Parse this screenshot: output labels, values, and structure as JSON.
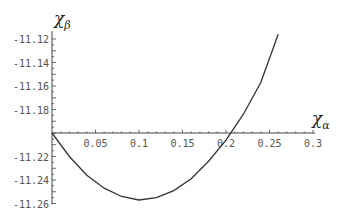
{
  "chart_data": {
    "type": "line",
    "title": "",
    "xlabel": "χ_α",
    "ylabel": "χ_β",
    "xlabel_main": "χ",
    "xlabel_sub": "α",
    "ylabel_main": "χ",
    "ylabel_sub": "β",
    "xlim": [
      0,
      0.3
    ],
    "ylim": [
      -11.26,
      -11.115
    ],
    "x_axis_crosses_at": -11.2,
    "x_ticks": [
      0.05,
      0.1,
      0.15,
      0.2,
      0.25,
      0.3
    ],
    "x_tick_labels": [
      "0.05",
      "0.1",
      "0.15",
      "0.2",
      "0.25",
      "0.3"
    ],
    "y_ticks": [
      -11.12,
      -11.14,
      -11.16,
      -11.18,
      -11.22,
      -11.24,
      -11.26
    ],
    "y_tick_labels": [
      "-11.12",
      "-11.14",
      "-11.16",
      "-11.18",
      "-11.22",
      "-11.24",
      "-11.26"
    ],
    "grid": false,
    "legend": null,
    "series": [
      {
        "name": "chi_beta(chi_alpha)",
        "x": [
          0,
          0.02,
          0.04,
          0.06,
          0.08,
          0.1,
          0.12,
          0.14,
          0.16,
          0.18,
          0.2,
          0.22,
          0.24,
          0.26
        ],
        "y": [
          -11.2,
          -11.22,
          -11.236,
          -11.247,
          -11.254,
          -11.257,
          -11.255,
          -11.249,
          -11.239,
          -11.224,
          -11.206,
          -11.184,
          -11.157,
          -11.116
        ]
      }
    ]
  }
}
